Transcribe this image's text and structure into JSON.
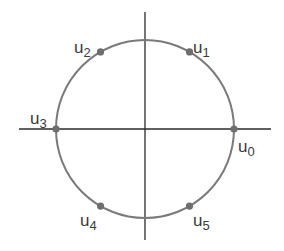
{
  "diagram": {
    "type": "unit-circle-roots",
    "colors": {
      "background": "#ffffff",
      "axis": "#2b2b2b",
      "circle": "#7a7a7a",
      "point": "#6e6e6e",
      "label": "#3a3a3a"
    },
    "center": {
      "x": 145,
      "y": 129
    },
    "radius": 89,
    "axes": {
      "horizontal": {
        "x1": 19,
        "x2": 271
      },
      "vertical": {
        "y1": 12,
        "y2": 240
      }
    },
    "points": [
      {
        "base": "u",
        "sub": "0",
        "angle_deg": 0,
        "label_x": 238,
        "label_y": 152
      },
      {
        "base": "u",
        "sub": "1",
        "angle_deg": 60,
        "label_x": 193,
        "label_y": 53
      },
      {
        "base": "u",
        "sub": "2",
        "angle_deg": 120,
        "label_x": 74,
        "label_y": 53
      },
      {
        "base": "u",
        "sub": "3",
        "angle_deg": 180,
        "label_x": 30,
        "label_y": 124
      },
      {
        "base": "u",
        "sub": "4",
        "angle_deg": 240,
        "label_x": 80,
        "label_y": 226
      },
      {
        "base": "u",
        "sub": "5",
        "angle_deg": 300,
        "label_x": 193,
        "label_y": 226
      }
    ]
  }
}
